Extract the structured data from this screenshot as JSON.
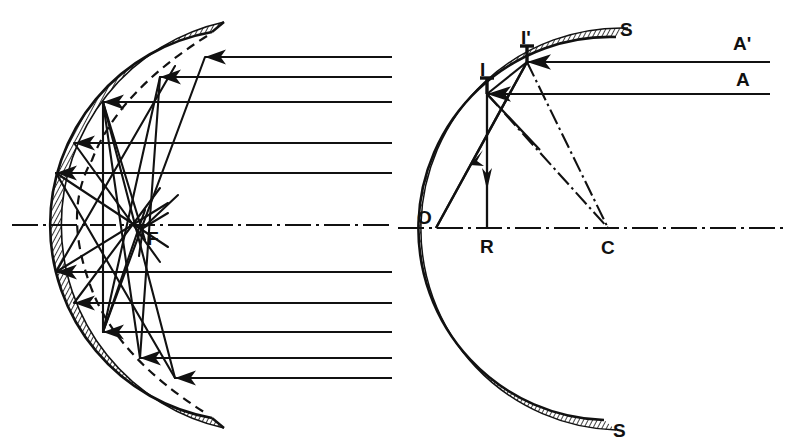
{
  "figure": {
    "background_color": "#ffffff",
    "ink_color": "#111111",
    "panels": [
      {
        "id": "left",
        "name": "spherical-aberration-caustic",
        "description": "Wide concave spherical mirror with parallel incident rays reflecting to form a caustic near the focus; dashed curve shows the ideal paraboloid.",
        "axis_style": "dash-dot",
        "labels": [
          {
            "key": "F",
            "text": "F",
            "x": 147,
            "y": 245,
            "meaning": "paraxial-focus"
          }
        ],
        "incident_rays_y": [
          57,
          77,
          102,
          143,
          173,
          272,
          303,
          332,
          358,
          378
        ],
        "mirror": {
          "vertex_x": 42,
          "center_y": 225,
          "radius": 192,
          "hatched": true,
          "dashed_paraboloid": true
        }
      },
      {
        "id": "right",
        "name": "construction-of-reflected-rays",
        "description": "Concave mirror SS with optical axis through pole O and centre of curvature C; incident rays A and A' strike at I and I'; dash-dot normals IC and I'C; reflected rays shown solid with arrowheads.",
        "axis_style": "dash-dot",
        "labels": [
          {
            "key": "S_top",
            "text": "S",
            "x": 620,
            "y": 36,
            "meaning": "mirror-surface-upper-end"
          },
          {
            "key": "S_bottom",
            "text": "S",
            "x": 613,
            "y": 432,
            "meaning": "mirror-surface-lower-end"
          },
          {
            "key": "I_prime",
            "text": "I'",
            "x": 521,
            "y": 48,
            "meaning": "upper-incidence-point"
          },
          {
            "key": "I",
            "text": "I",
            "x": 482,
            "y": 82,
            "meaning": "lower-incidence-point"
          },
          {
            "key": "A_prime",
            "text": "A'",
            "x": 733,
            "y": 56,
            "meaning": "upper-incident-ray"
          },
          {
            "key": "A",
            "text": "A",
            "x": 738,
            "y": 93,
            "meaning": "lower-incident-ray"
          },
          {
            "key": "O",
            "text": "O",
            "x": 420,
            "y": 222,
            "meaning": "pole-of-mirror"
          },
          {
            "key": "R",
            "text": "R",
            "x": 482,
            "y": 249,
            "meaning": "reflected-ray-foot"
          },
          {
            "key": "C",
            "text": "C",
            "x": 602,
            "y": 250,
            "meaning": "centre-of-curvature"
          }
        ],
        "points": {
          "O": {
            "x": 436,
            "y": 228
          },
          "R": {
            "x": 487,
            "y": 228
          },
          "C": {
            "x": 608,
            "y": 228
          },
          "I": {
            "x": 487,
            "y": 94
          },
          "I_prime": {
            "x": 527,
            "y": 62
          }
        },
        "incident_rays": [
          {
            "name": "A-prime-ray",
            "y": 62,
            "x_from": 770,
            "x_to": 527,
            "arrow_x": 640
          },
          {
            "name": "A-ray",
            "y": 94,
            "x_from": 770,
            "x_to": 487,
            "arrow_x": 640
          }
        ],
        "mirror": {
          "vertex_x": 436,
          "center_y": 228,
          "radius": 172,
          "hatched": true
        }
      }
    ]
  }
}
